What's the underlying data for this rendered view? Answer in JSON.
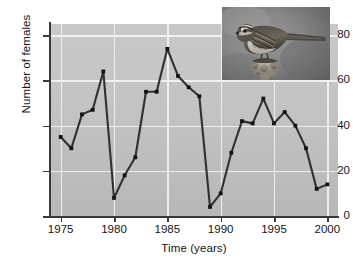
{
  "figure": {
    "inset_photo": {
      "name": "song-sparrow-photograph",
      "alt": "Photograph of a song sparrow perched on a twig",
      "caption": ""
    }
  },
  "chart_data": {
    "type": "line",
    "title": "",
    "xlabel": "Time (years)",
    "ylabel": "Number of females",
    "xlim": [
      1974,
      2001
    ],
    "ylim": [
      0,
      85
    ],
    "xticks": [
      1975,
      1980,
      1985,
      1990,
      1995,
      2000
    ],
    "yticks": [
      0,
      20,
      40,
      60,
      80
    ],
    "xtick_labels": [
      "1975",
      "1980",
      "1985",
      "1990",
      "1995",
      "2000"
    ],
    "ytick_labels": [
      "0",
      "20",
      "40",
      "60",
      "80"
    ],
    "grid": true,
    "grid_color": "#f2f2f2",
    "legend": null,
    "legend_position": "none",
    "plot_background": "#c2c2c2",
    "line_color": "#303030",
    "marker": "square",
    "marker_color": "#121212",
    "x": [
      1975,
      1976,
      1977,
      1978,
      1979,
      1980,
      1981,
      1982,
      1983,
      1984,
      1985,
      1986,
      1987,
      1988,
      1989,
      1990,
      1991,
      1992,
      1993,
      1994,
      1995,
      1996,
      1997,
      1998,
      1999,
      2000
    ],
    "values": [
      35,
      30,
      45,
      47,
      64,
      8,
      18,
      26,
      55,
      55,
      74,
      62,
      57,
      53,
      4,
      10,
      28,
      42,
      41,
      52,
      41,
      46,
      40,
      30,
      12,
      14
    ],
    "series": [
      {
        "name": "Number of females",
        "values": [
          35,
          30,
          45,
          47,
          64,
          8,
          18,
          26,
          55,
          55,
          74,
          62,
          57,
          53,
          4,
          10,
          28,
          42,
          41,
          52,
          41,
          46,
          40,
          30,
          12,
          14
        ]
      }
    ]
  }
}
